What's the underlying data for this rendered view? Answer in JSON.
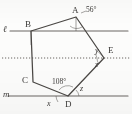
{
  "figure": {
    "type": "geometry-diagram",
    "vertices": [
      {
        "name": "A",
        "x": 76,
        "y": 17,
        "label_x": 72,
        "label_y": 6
      },
      {
        "name": "B",
        "x": 31,
        "y": 31,
        "label_x": 25,
        "label_y": 20
      },
      {
        "name": "C",
        "x": 33,
        "y": 82,
        "label_x": 22,
        "label_y": 76
      },
      {
        "name": "D",
        "x": 68,
        "y": 96,
        "label_x": 65,
        "label_y": 100
      },
      {
        "name": "E",
        "x": 104,
        "y": 58,
        "label_x": 108,
        "label_y": 46
      }
    ],
    "lines": [
      {
        "name": "l",
        "label": "ℓ",
        "style": "solid",
        "y": 31,
        "x1": 10,
        "x2": 128,
        "label_x": 3,
        "label_y": 25
      },
      {
        "name": "dotted",
        "label": "",
        "style": "dotted",
        "y": 58,
        "x1": 2,
        "x2": 130,
        "label_x": 0,
        "label_y": 0
      },
      {
        "name": "m",
        "label": "m",
        "style": "solid",
        "y": 96,
        "x1": 8,
        "x2": 128,
        "label_x": 3,
        "label_y": 90
      }
    ],
    "angles": [
      {
        "name": "angle-a",
        "label": "56°",
        "label_x": 86,
        "label_y": 9,
        "vertex": "A"
      },
      {
        "name": "angle-y",
        "label": "y",
        "label_x": 95,
        "label_y": 48,
        "vertex": "E"
      },
      {
        "name": "angle-z-e",
        "label": "z",
        "label_x": 95,
        "label_y": 62,
        "vertex": "E"
      },
      {
        "name": "angle-d-interior",
        "label": "108°",
        "label_x": 52,
        "label_y": 80,
        "vertex": "D"
      },
      {
        "name": "angle-z-d",
        "label": "z",
        "label_x": 80,
        "label_y": 86,
        "vertex": "D"
      },
      {
        "name": "angle-x",
        "label": "x",
        "label_x": 47,
        "label_y": 101,
        "vertex": "D"
      }
    ],
    "colors": {
      "stroke": "#4a4744",
      "line_stroke": "#6a6663",
      "background": "#fdfdfc",
      "text": "#3c3a38"
    }
  }
}
